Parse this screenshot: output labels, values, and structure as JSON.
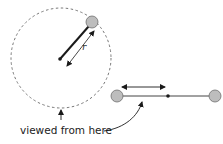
{
  "diagram": {
    "labels": {
      "radius": "r",
      "caption": "viewed from here"
    },
    "colors": {
      "ball_fill": "#bdbdbd",
      "ball_stroke": "#6e6e6e",
      "line": "#1a1a1a",
      "dashed_circle": "#777777",
      "text": "#222222"
    },
    "top_view": {
      "orbit_circle": {
        "cx": 61,
        "cy": 58,
        "r": 50,
        "style": "dashed"
      },
      "center_point": {
        "x": 60,
        "y": 59
      },
      "ball": {
        "x": 92,
        "y": 22,
        "r": 6
      },
      "radius_arrow": {
        "from": [
          66,
          67
        ],
        "to": [
          95,
          32
        ]
      }
    },
    "side_view": {
      "left_ball": {
        "x": 117,
        "y": 96,
        "r": 6
      },
      "right_ball": {
        "x": 215,
        "y": 96,
        "r": 6
      },
      "center_point": {
        "x": 168,
        "y": 96
      },
      "motion_arrow": {
        "from": [
          121,
          87
        ],
        "to": [
          166,
          87
        ]
      }
    }
  }
}
